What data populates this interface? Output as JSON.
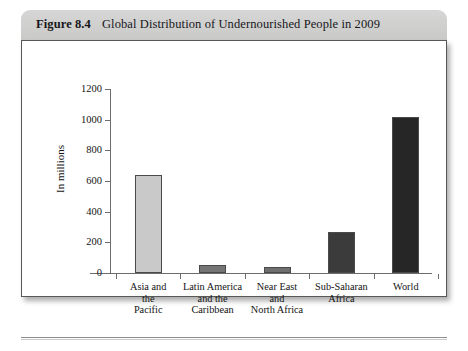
{
  "figure": {
    "number": "Figure 8.4",
    "title": "Global Distribution of Undernourished People in 2009"
  },
  "chart_data": {
    "type": "bar",
    "title": "Global Distribution of Undernourished People in 2009",
    "xlabel": "",
    "ylabel": "In millions",
    "ylim": [
      0,
      1200
    ],
    "yticks": [
      0,
      200,
      400,
      600,
      800,
      1000,
      1200
    ],
    "ytick_labels": [
      "0",
      "200",
      "400",
      "600",
      "800",
      "1000",
      "1200"
    ],
    "grid": false,
    "legend": "none",
    "categories": [
      "Asia and the Pacific",
      "Latin America and the Caribbean",
      "Near East and North Africa",
      "Sub-Saharan Africa",
      "World"
    ],
    "category_lines": [
      [
        "Asia and",
        "the",
        "Pacific"
      ],
      [
        "Latin America",
        "and the",
        "Caribbean"
      ],
      [
        "Near East",
        "and",
        "North Africa"
      ],
      [
        "Sub-Saharan",
        "Africa"
      ],
      [
        "World"
      ]
    ],
    "values": [
      642,
      53,
      42,
      265,
      1020
    ],
    "bar_colors": [
      "#c9c9c9",
      "#757575",
      "#6f6f6f",
      "#3b3b3b",
      "#262626"
    ],
    "bar_edge_color": "#4a4a4a"
  },
  "colors": {
    "header_band": "#cfcfce",
    "panel_background": "#ffffff",
    "panel_border": "#585858",
    "axis": "#6d6d6d",
    "text": "#141414"
  }
}
